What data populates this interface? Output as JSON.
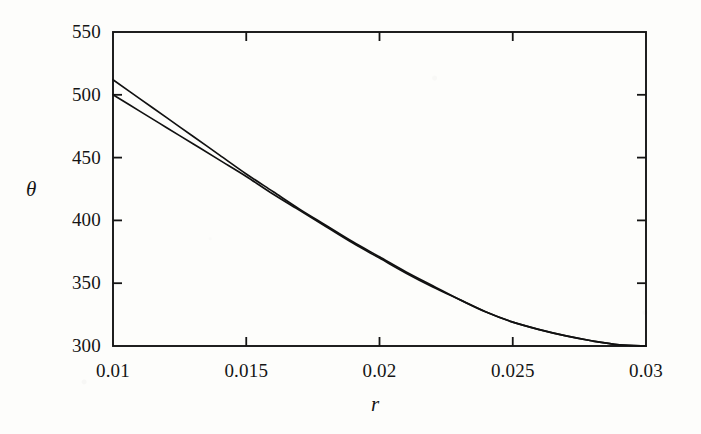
{
  "chart_data": {
    "type": "line",
    "title": "",
    "subtitle": "",
    "xlabel": "r",
    "ylabel": "θ",
    "xlim": [
      0.01,
      0.03
    ],
    "ylim": [
      300,
      550
    ],
    "grid": false,
    "legend": "none",
    "annotations": [],
    "x_ticks": [
      {
        "value": 0.01,
        "label": "0.01"
      },
      {
        "value": 0.015,
        "label": "0.015"
      },
      {
        "value": 0.02,
        "label": "0.02"
      },
      {
        "value": 0.025,
        "label": "0.025"
      },
      {
        "value": 0.03,
        "label": "0.03"
      }
    ],
    "y_ticks": [
      {
        "value": 300,
        "label": "300"
      },
      {
        "value": 350,
        "label": "350"
      },
      {
        "value": 400,
        "label": "400"
      },
      {
        "value": 450,
        "label": "450"
      },
      {
        "value": 500,
        "label": "500"
      },
      {
        "value": 550,
        "label": "550"
      }
    ],
    "x": [
      0.01,
      0.011,
      0.012,
      0.013,
      0.014,
      0.015,
      0.016,
      0.017,
      0.018,
      0.019,
      0.02,
      0.021,
      0.022,
      0.023,
      0.024,
      0.025,
      0.026,
      0.027,
      0.028,
      0.029,
      0.03
    ],
    "series": [
      {
        "name": "upper-curve",
        "color": "#111111",
        "values": [
          512,
          497,
          482,
          467,
          452,
          437,
          423,
          409,
          396,
          383,
          371,
          359,
          348,
          337,
          327,
          319,
          313,
          308,
          304,
          301,
          300
        ]
      },
      {
        "name": "lower-curve",
        "color": "#111111",
        "values": [
          500,
          487,
          474,
          461,
          448,
          435,
          421,
          408,
          395,
          382,
          370,
          358,
          347,
          337,
          327,
          319,
          313,
          308,
          304,
          301,
          300
        ]
      }
    ]
  },
  "plot": {
    "frame_color": "#141414",
    "background_color": "#fdfdfb",
    "geometry": {
      "left": 113,
      "right": 646,
      "top": 32,
      "bottom": 346
    }
  }
}
